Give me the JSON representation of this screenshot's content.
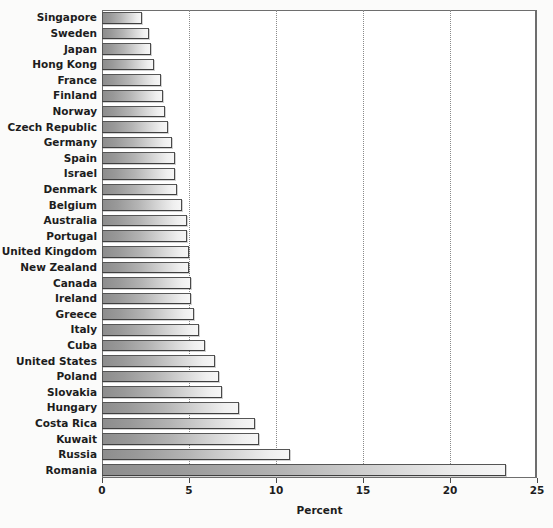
{
  "chart_data": {
    "type": "bar",
    "orientation": "horizontal",
    "title": "",
    "xlabel": "Percent",
    "ylabel": "",
    "xlim": [
      0,
      25
    ],
    "xticks": [
      0,
      5,
      10,
      15,
      20,
      25
    ],
    "xtick_labels": [
      "0",
      "5",
      "10",
      "15",
      "20",
      "25"
    ],
    "grid": "vertical-dotted",
    "legend": "none",
    "categories": [
      "Singapore",
      "Sweden",
      "Japan",
      "Hong Kong",
      "France",
      "Finland",
      "Norway",
      "Czech Republic",
      "Germany",
      "Spain",
      "Israel",
      "Denmark",
      "Belgium",
      "Australia",
      "Portugal",
      "United Kingdom",
      "New Zealand",
      "Canada",
      "Ireland",
      "Greece",
      "Italy",
      "Cuba",
      "United States",
      "Poland",
      "Slovakia",
      "Hungary",
      "Costa Rica",
      "Kuwait",
      "Russia",
      "Romania"
    ],
    "values": [
      2.3,
      2.7,
      2.8,
      3.0,
      3.4,
      3.5,
      3.6,
      3.8,
      4.0,
      4.2,
      4.2,
      4.3,
      4.6,
      4.9,
      4.9,
      5.0,
      5.0,
      5.1,
      5.1,
      5.3,
      5.6,
      5.9,
      6.5,
      6.7,
      6.9,
      7.9,
      8.8,
      9.0,
      10.8,
      23.2
    ]
  },
  "axis": {
    "x_title": "Percent"
  }
}
